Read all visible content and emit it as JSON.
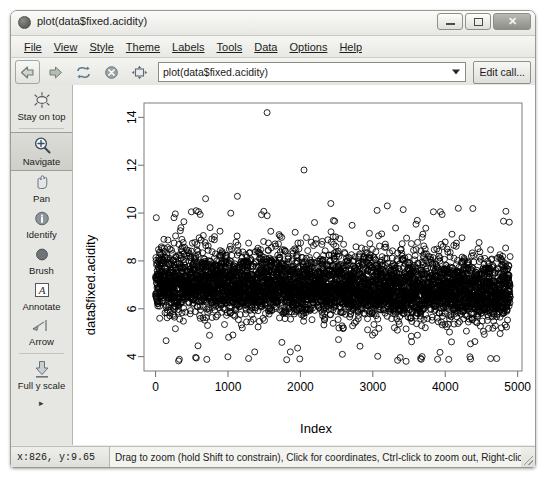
{
  "window": {
    "title": "plot(data$fixed.acidity)",
    "icon": "app-icon",
    "buttons": {
      "minimize": "–",
      "maximize": "□",
      "close": "✕"
    }
  },
  "menubar": {
    "items": [
      {
        "label": "File",
        "accel": "F"
      },
      {
        "label": "View",
        "accel": "V"
      },
      {
        "label": "Style",
        "accel": "S"
      },
      {
        "label": "Theme",
        "accel": "e"
      },
      {
        "label": "Labels",
        "accel": "L"
      },
      {
        "label": "Tools",
        "accel": "T"
      },
      {
        "label": "Data",
        "accel": "D"
      },
      {
        "label": "Options",
        "accel": "O"
      },
      {
        "label": "Help",
        "accel": "H"
      }
    ]
  },
  "toolbar": {
    "back_icon": "back-arrow-icon",
    "forward_icon": "forward-arrow-icon",
    "refresh_icon": "refresh-icon",
    "stop_icon": "stop-icon",
    "fit_icon": "fit-to-window-icon",
    "command_value": "plot(data$fixed.acidity)",
    "command_placeholder": "plot(...)",
    "dropdown_icon": "chevron-down-icon",
    "edit_call_label": "Edit call..."
  },
  "sidebar": {
    "items": [
      {
        "label": "Stay on top",
        "icon": "stay-on-top-icon",
        "selected": false
      },
      {
        "label": "Navigate",
        "icon": "magnifier-plus-icon",
        "selected": true
      },
      {
        "label": "Pan",
        "icon": "pan-hand-icon",
        "selected": false
      },
      {
        "label": "Identify",
        "icon": "info-circle-icon",
        "selected": false
      },
      {
        "label": "Brush",
        "icon": "brush-dot-icon",
        "selected": false
      },
      {
        "label": "Annotate",
        "icon": "letter-a-icon",
        "selected": false
      },
      {
        "label": "Arrow",
        "icon": "arrow-tool-icon",
        "selected": false
      },
      {
        "label": "Full y scale",
        "icon": "down-arrow-scale-icon",
        "selected": false
      }
    ],
    "more_icon": "▸"
  },
  "statusbar": {
    "coordinates": "x:826,  y:9.65",
    "hint": "Drag to zoom (hold Shift to constrain), Click for coordinates, Ctrl-click to zoom out, Right-click for ...",
    "resize_grip": "resize-grip-icon"
  },
  "chart_data": {
    "type": "scatter",
    "title": "",
    "xlabel": "Index",
    "ylabel": "data$fixed.acidity",
    "xticks": [
      0,
      1000,
      2000,
      3000,
      4000,
      5000
    ],
    "yticks": [
      4,
      6,
      8,
      10,
      12,
      14
    ],
    "xlim": [
      -160,
      5060
    ],
    "ylim": [
      3.4,
      14.6
    ],
    "grid": false,
    "legend": null,
    "marker": {
      "shape": "open-circle",
      "size": 3.0,
      "color": "#000000",
      "fill": "none"
    },
    "n_points": 4898,
    "series": [
      {
        "name": "fixed.acidity",
        "density_profile": {
          "core_center": 6.85,
          "core_halfwidth": 0.55,
          "mid_halfwidth": 1.05,
          "tail_low": 3.8,
          "tail_high": 10.3,
          "drift_start": 7.05,
          "drift_end": 6.65
        },
        "outliers": [
          {
            "x": 1540,
            "y": 14.2
          },
          {
            "x": 2050,
            "y": 11.8
          },
          {
            "x": 1130,
            "y": 10.7
          },
          {
            "x": 690,
            "y": 10.6
          },
          {
            "x": 2420,
            "y": 10.4
          },
          {
            "x": 3200,
            "y": 10.3
          },
          {
            "x": 4180,
            "y": 10.2
          },
          {
            "x": 560,
            "y": 10.1
          },
          {
            "x": 1860,
            "y": 4.2
          },
          {
            "x": 2580,
            "y": 4.1
          },
          {
            "x": 3680,
            "y": 4.0
          },
          {
            "x": 4350,
            "y": 3.9
          }
        ]
      }
    ]
  }
}
